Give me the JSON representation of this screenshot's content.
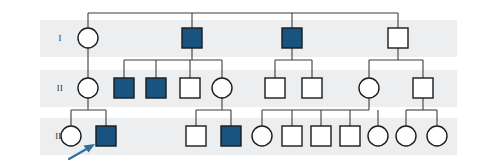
{
  "figure": {
    "type": "pedigree-chart",
    "width": 483,
    "height": 165,
    "background": "#ffffff",
    "band_color": "#eceef0",
    "line_color": "#3c3c3c",
    "affected_fill": "#18547f",
    "unaffected_fill": "#ffffff",
    "symbol_stroke": "#1a1a1a",
    "proband_arrow_color": "#2f6f9e"
  },
  "generations": [
    {
      "label": "I",
      "band_y": 20,
      "band_height": 37,
      "symbol_cy": 38
    },
    {
      "label": "II",
      "band_y": 70,
      "band_height": 37,
      "symbol_cy": 88
    },
    {
      "label": "III",
      "band_y": 118,
      "band_height": 37,
      "symbol_cy": 136
    }
  ],
  "band_x": 40,
  "band_width": 417,
  "legend": {
    "filled_meaning": "affected",
    "open_meaning": "unaffected",
    "square_meaning": "male",
    "circle_meaning": "female",
    "arrow_meaning": "proband"
  },
  "individuals": [
    {
      "id": "I-1",
      "generation": "I",
      "sex": "female",
      "shape": "circle",
      "affected": false,
      "cx": 88,
      "cy": 38
    },
    {
      "id": "I-2",
      "generation": "I",
      "sex": "male",
      "shape": "square",
      "affected": true,
      "cx": 192,
      "cy": 38
    },
    {
      "id": "I-3",
      "generation": "I",
      "sex": "male",
      "shape": "square",
      "affected": true,
      "cx": 292,
      "cy": 38
    },
    {
      "id": "I-4",
      "generation": "I",
      "sex": "male",
      "shape": "square",
      "affected": false,
      "cx": 398,
      "cy": 38
    },
    {
      "id": "II-1",
      "generation": "II",
      "sex": "female",
      "shape": "circle",
      "affected": false,
      "cx": 88,
      "cy": 88
    },
    {
      "id": "II-2",
      "generation": "II",
      "sex": "male",
      "shape": "square",
      "affected": true,
      "cx": 124,
      "cy": 88
    },
    {
      "id": "II-3",
      "generation": "II",
      "sex": "male",
      "shape": "square",
      "affected": true,
      "cx": 156,
      "cy": 88
    },
    {
      "id": "II-4",
      "generation": "II",
      "sex": "male",
      "shape": "square",
      "affected": false,
      "cx": 190,
      "cy": 88
    },
    {
      "id": "II-5",
      "generation": "II",
      "sex": "female",
      "shape": "circle",
      "affected": false,
      "cx": 222,
      "cy": 88
    },
    {
      "id": "II-6",
      "generation": "II",
      "sex": "male",
      "shape": "square",
      "affected": false,
      "cx": 275,
      "cy": 88
    },
    {
      "id": "II-7",
      "generation": "II",
      "sex": "male",
      "shape": "square",
      "affected": false,
      "cx": 312,
      "cy": 88
    },
    {
      "id": "II-8",
      "generation": "II",
      "sex": "female",
      "shape": "circle",
      "affected": false,
      "cx": 369,
      "cy": 88
    },
    {
      "id": "II-9",
      "generation": "II",
      "sex": "male",
      "shape": "square",
      "affected": false,
      "cx": 423,
      "cy": 88
    },
    {
      "id": "III-1",
      "generation": "III",
      "sex": "female",
      "shape": "circle",
      "affected": false,
      "cx": 71,
      "cy": 136
    },
    {
      "id": "III-2",
      "generation": "III",
      "sex": "male",
      "shape": "square",
      "affected": true,
      "cx": 106,
      "cy": 136,
      "proband": true
    },
    {
      "id": "III-3",
      "generation": "III",
      "sex": "male",
      "shape": "square",
      "affected": false,
      "cx": 196,
      "cy": 136
    },
    {
      "id": "III-4",
      "generation": "III",
      "sex": "male",
      "shape": "square",
      "affected": true,
      "cx": 231,
      "cy": 136
    },
    {
      "id": "III-5",
      "generation": "III",
      "sex": "female",
      "shape": "circle",
      "affected": false,
      "cx": 262,
      "cy": 136
    },
    {
      "id": "III-6",
      "generation": "III",
      "sex": "male",
      "shape": "square",
      "affected": false,
      "cx": 292,
      "cy": 136
    },
    {
      "id": "III-7",
      "generation": "III",
      "sex": "male",
      "shape": "square",
      "affected": false,
      "cx": 321,
      "cy": 136
    },
    {
      "id": "III-8",
      "generation": "III",
      "sex": "male",
      "shape": "square",
      "affected": false,
      "cx": 350,
      "cy": 136
    },
    {
      "id": "III-9",
      "generation": "III",
      "sex": "female",
      "shape": "circle",
      "affected": false,
      "cx": 378,
      "cy": 136
    },
    {
      "id": "III-10",
      "generation": "III",
      "sex": "female",
      "shape": "circle",
      "affected": false,
      "cx": 406,
      "cy": 136
    },
    {
      "id": "III-11",
      "generation": "III",
      "sex": "female",
      "shape": "circle",
      "affected": false,
      "cx": 437,
      "cy": 136
    }
  ],
  "connectors": {
    "top_sibship_y": 13,
    "top_sibship_x1": 88,
    "top_sibship_x2": 398,
    "gen2_sibship_y": 60,
    "gen3_sibship_y": 110
  },
  "proband": {
    "id": "III-2",
    "arrow_tail_x": 70,
    "arrow_tail_y": 159,
    "arrow_tip_x": 95,
    "arrow_tip_y": 145
  }
}
